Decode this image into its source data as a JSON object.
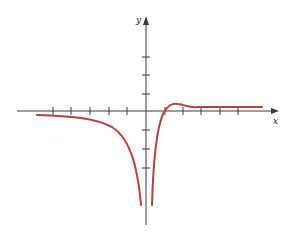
{
  "diagram": {
    "type": "function-graph",
    "axes": {
      "x_label": "x",
      "y_label": "y",
      "axis_color": "#3a3a3a",
      "x_ticks_left": 5,
      "x_ticks_right": 5,
      "y_ticks_up": 3,
      "y_ticks_down": 3
    },
    "curve": {
      "color": "#b5443f",
      "description": "Vertical asymptote at x=0 (both branches go to -infinity); horizontal asymptote slightly above x-axis on the right, approaching from below on the left; right branch crosses x-axis near x=1, peaks slightly near x=2, then levels off"
    }
  }
}
